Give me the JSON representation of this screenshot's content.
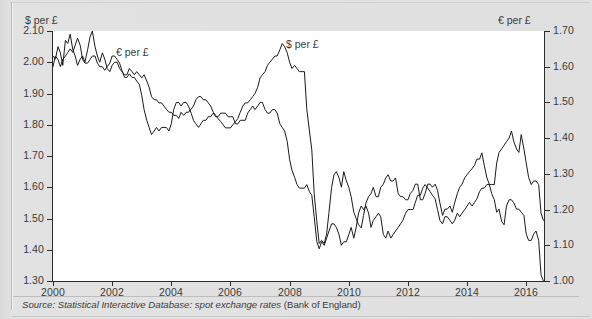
{
  "figure": {
    "source_prefix": "Source: Statistical Interactive Database: spot exchange rates",
    "source_suffix": " (Bank of England)"
  },
  "axes": {
    "left_title": "$ per £",
    "right_title": "€ per £",
    "left_ticks": [
      "2.10",
      "2.00",
      "1.90",
      "1.80",
      "1.70",
      "1.60",
      "1.50",
      "1.40",
      "1.30"
    ],
    "right_ticks": [
      "1.70",
      "1.60",
      "1.50",
      "1.40",
      "1.30",
      "1.20",
      "1.10",
      "1.00"
    ],
    "bottom_ticks": [
      "2000",
      "2002",
      "2004",
      "2006",
      "2008",
      "2010",
      "2012",
      "2014",
      "2016"
    ]
  },
  "labels": {
    "eur_series": "€ per £",
    "usd_series": "$ per £"
  },
  "colors": {
    "line": "#1a1a1a",
    "background": "#e0e0e0",
    "plot_background": "#ffffff",
    "axis": "#2b2b2b"
  },
  "chart_data": {
    "type": "line",
    "title": "",
    "subtitle": "",
    "xlabel": "",
    "ylabel": "$ per £",
    "y2label": "€ per £",
    "grid": false,
    "legend": "inline-annotations",
    "xlim": [
      2000.0,
      2016.6
    ],
    "ylim": [
      1.3,
      2.1
    ],
    "y2lim": [
      1.0,
      1.7
    ],
    "xticks": [
      2000,
      2002,
      2004,
      2006,
      2008,
      2010,
      2012,
      2014,
      2016
    ],
    "yticks": [
      1.3,
      1.4,
      1.5,
      1.6,
      1.7,
      1.8,
      1.9,
      2.0,
      2.1
    ],
    "y2ticks": [
      1.0,
      1.1,
      1.2,
      1.3,
      1.4,
      1.5,
      1.6,
      1.7
    ],
    "annotations": [
      {
        "text": "€ per £",
        "x": 2001.0,
        "axis": "right"
      },
      {
        "text": "$ per £",
        "x": 2007.6,
        "axis": "left"
      }
    ],
    "series": [
      {
        "name": "$ per £",
        "axis": "left",
        "units": "US dollars per pound sterling",
        "x": [
          2000.0,
          2000.08,
          2000.17,
          2000.25,
          2000.33,
          2000.42,
          2000.5,
          2000.58,
          2000.67,
          2000.75,
          2000.83,
          2000.92,
          2001.0,
          2001.08,
          2001.17,
          2001.25,
          2001.33,
          2001.42,
          2001.5,
          2001.58,
          2001.67,
          2001.75,
          2001.83,
          2001.92,
          2002.0,
          2002.08,
          2002.17,
          2002.25,
          2002.33,
          2002.42,
          2002.5,
          2002.58,
          2002.67,
          2002.75,
          2002.83,
          2002.92,
          2003.0,
          2003.08,
          2003.17,
          2003.25,
          2003.33,
          2003.42,
          2003.5,
          2003.58,
          2003.67,
          2003.75,
          2003.83,
          2003.92,
          2004.0,
          2004.08,
          2004.17,
          2004.25,
          2004.33,
          2004.42,
          2004.5,
          2004.58,
          2004.67,
          2004.75,
          2004.83,
          2004.92,
          2005.0,
          2005.08,
          2005.17,
          2005.25,
          2005.33,
          2005.42,
          2005.5,
          2005.58,
          2005.67,
          2005.75,
          2005.83,
          2005.92,
          2006.0,
          2006.08,
          2006.17,
          2006.25,
          2006.33,
          2006.42,
          2006.5,
          2006.58,
          2006.67,
          2006.75,
          2006.83,
          2006.92,
          2007.0,
          2007.08,
          2007.17,
          2007.25,
          2007.33,
          2007.42,
          2007.5,
          2007.58,
          2007.67,
          2007.75,
          2007.83,
          2007.92,
          2008.0,
          2008.08,
          2008.17,
          2008.25,
          2008.33,
          2008.42,
          2008.5,
          2008.58,
          2008.67,
          2008.75,
          2008.83,
          2008.92,
          2009.0,
          2009.08,
          2009.17,
          2009.25,
          2009.33,
          2009.42,
          2009.5,
          2009.58,
          2009.67,
          2009.75,
          2009.83,
          2009.92,
          2010.0,
          2010.08,
          2010.17,
          2010.25,
          2010.33,
          2010.42,
          2010.5,
          2010.58,
          2010.67,
          2010.75,
          2010.83,
          2010.92,
          2011.0,
          2011.08,
          2011.17,
          2011.25,
          2011.33,
          2011.42,
          2011.5,
          2011.58,
          2011.67,
          2011.75,
          2011.83,
          2011.92,
          2012.0,
          2012.08,
          2012.17,
          2012.25,
          2012.33,
          2012.42,
          2012.5,
          2012.58,
          2012.67,
          2012.75,
          2012.83,
          2012.92,
          2013.0,
          2013.08,
          2013.17,
          2013.25,
          2013.33,
          2013.42,
          2013.5,
          2013.58,
          2013.67,
          2013.75,
          2013.83,
          2013.92,
          2014.0,
          2014.08,
          2014.17,
          2014.25,
          2014.33,
          2014.42,
          2014.5,
          2014.58,
          2014.67,
          2014.75,
          2014.83,
          2014.92,
          2015.0,
          2015.08,
          2015.17,
          2015.25,
          2015.33,
          2015.42,
          2015.5,
          2015.58,
          2015.67,
          2015.75,
          2015.83,
          2015.92,
          2016.0,
          2016.08,
          2016.17,
          2016.25,
          2016.33,
          2016.42,
          2016.5,
          2016.58
        ],
        "y": [
          2.02,
          2.01,
          2.05,
          2.03,
          1.99,
          2.07,
          2.06,
          2.09,
          2.04,
          2.02,
          1.99,
          2.01,
          2.02,
          2.0,
          2.04,
          2.08,
          2.1,
          2.05,
          2.02,
          2.0,
          2.03,
          2.01,
          1.98,
          1.97,
          1.99,
          2.0,
          2.0,
          1.98,
          1.97,
          1.96,
          1.96,
          1.98,
          1.97,
          1.96,
          1.97,
          1.96,
          1.95,
          1.96,
          1.94,
          1.92,
          1.89,
          1.88,
          1.88,
          1.87,
          1.87,
          1.86,
          1.85,
          1.84,
          1.84,
          1.83,
          1.83,
          1.82,
          1.84,
          1.83,
          1.84,
          1.84,
          1.85,
          1.86,
          1.88,
          1.89,
          1.89,
          1.88,
          1.88,
          1.87,
          1.86,
          1.84,
          1.83,
          1.82,
          1.81,
          1.8,
          1.79,
          1.79,
          1.79,
          1.8,
          1.81,
          1.82,
          1.84,
          1.86,
          1.87,
          1.87,
          1.88,
          1.89,
          1.9,
          1.92,
          1.95,
          1.96,
          1.97,
          1.99,
          2.0,
          2.01,
          2.02,
          2.02,
          2.04,
          2.06,
          2.05,
          2.03,
          2.0,
          1.98,
          1.99,
          1.98,
          1.97,
          1.97,
          1.97,
          1.85,
          1.78,
          1.72,
          1.58,
          1.49,
          1.42,
          1.43,
          1.42,
          1.45,
          1.52,
          1.6,
          1.64,
          1.65,
          1.63,
          1.6,
          1.65,
          1.62,
          1.6,
          1.57,
          1.52,
          1.5,
          1.48,
          1.47,
          1.51,
          1.55,
          1.57,
          1.58,
          1.6,
          1.57,
          1.57,
          1.6,
          1.61,
          1.63,
          1.64,
          1.62,
          1.62,
          1.63,
          1.58,
          1.57,
          1.57,
          1.56,
          1.56,
          1.58,
          1.59,
          1.61,
          1.61,
          1.56,
          1.56,
          1.58,
          1.61,
          1.61,
          1.6,
          1.61,
          1.59,
          1.55,
          1.51,
          1.53,
          1.53,
          1.54,
          1.52,
          1.55,
          1.58,
          1.6,
          1.61,
          1.63,
          1.64,
          1.65,
          1.66,
          1.67,
          1.69,
          1.69,
          1.71,
          1.67,
          1.63,
          1.61,
          1.58,
          1.56,
          1.52,
          1.53,
          1.49,
          1.48,
          1.54,
          1.56,
          1.56,
          1.55,
          1.53,
          1.53,
          1.52,
          1.51,
          1.45,
          1.43,
          1.43,
          1.45,
          1.46,
          1.43,
          1.32,
          1.3
        ]
      },
      {
        "name": "€ per £",
        "axis": "right",
        "units": "euros per pound sterling",
        "x": [
          2000.0,
          2000.08,
          2000.17,
          2000.25,
          2000.33,
          2000.42,
          2000.5,
          2000.58,
          2000.67,
          2000.75,
          2000.83,
          2000.92,
          2001.0,
          2001.08,
          2001.17,
          2001.25,
          2001.33,
          2001.42,
          2001.5,
          2001.58,
          2001.67,
          2001.75,
          2001.83,
          2001.92,
          2002.0,
          2002.08,
          2002.17,
          2002.25,
          2002.33,
          2002.42,
          2002.5,
          2002.58,
          2002.67,
          2002.75,
          2002.83,
          2002.92,
          2003.0,
          2003.08,
          2003.17,
          2003.25,
          2003.33,
          2003.42,
          2003.5,
          2003.58,
          2003.67,
          2003.75,
          2003.83,
          2003.92,
          2004.0,
          2004.08,
          2004.17,
          2004.25,
          2004.33,
          2004.42,
          2004.5,
          2004.58,
          2004.67,
          2004.75,
          2004.83,
          2004.92,
          2005.0,
          2005.08,
          2005.17,
          2005.25,
          2005.33,
          2005.42,
          2005.5,
          2005.58,
          2005.67,
          2005.75,
          2005.83,
          2005.92,
          2006.0,
          2006.08,
          2006.17,
          2006.25,
          2006.33,
          2006.42,
          2006.5,
          2006.58,
          2006.67,
          2006.75,
          2006.83,
          2006.92,
          2007.0,
          2007.08,
          2007.17,
          2007.25,
          2007.33,
          2007.42,
          2007.5,
          2007.58,
          2007.67,
          2007.75,
          2007.83,
          2007.92,
          2008.0,
          2008.08,
          2008.17,
          2008.25,
          2008.33,
          2008.42,
          2008.5,
          2008.58,
          2008.67,
          2008.75,
          2008.83,
          2008.92,
          2009.0,
          2009.08,
          2009.17,
          2009.25,
          2009.33,
          2009.42,
          2009.5,
          2009.58,
          2009.67,
          2009.75,
          2009.83,
          2009.92,
          2010.0,
          2010.08,
          2010.17,
          2010.25,
          2010.33,
          2010.42,
          2010.5,
          2010.58,
          2010.67,
          2010.75,
          2010.83,
          2010.92,
          2011.0,
          2011.08,
          2011.17,
          2011.25,
          2011.33,
          2011.42,
          2011.5,
          2011.58,
          2011.67,
          2011.75,
          2011.83,
          2011.92,
          2012.0,
          2012.08,
          2012.17,
          2012.25,
          2012.33,
          2012.42,
          2012.5,
          2012.58,
          2012.67,
          2012.75,
          2012.83,
          2012.92,
          2013.0,
          2013.08,
          2013.17,
          2013.25,
          2013.33,
          2013.42,
          2013.5,
          2013.58,
          2013.67,
          2013.75,
          2013.83,
          2013.92,
          2014.0,
          2014.08,
          2014.17,
          2014.25,
          2014.33,
          2014.42,
          2014.5,
          2014.58,
          2014.67,
          2014.75,
          2014.83,
          2014.92,
          2015.0,
          2015.08,
          2015.17,
          2015.25,
          2015.33,
          2015.42,
          2015.5,
          2015.58,
          2015.67,
          2015.75,
          2015.83,
          2015.92,
          2016.0,
          2016.08,
          2016.17,
          2016.25,
          2016.33,
          2016.42,
          2016.5,
          2016.58
        ],
        "y": [
          1.6,
          1.63,
          1.62,
          1.6,
          1.62,
          1.63,
          1.64,
          1.65,
          1.64,
          1.66,
          1.68,
          1.66,
          1.62,
          1.61,
          1.61,
          1.62,
          1.63,
          1.63,
          1.61,
          1.6,
          1.6,
          1.59,
          1.6,
          1.61,
          1.63,
          1.63,
          1.62,
          1.61,
          1.59,
          1.57,
          1.57,
          1.58,
          1.57,
          1.57,
          1.56,
          1.55,
          1.52,
          1.48,
          1.45,
          1.43,
          1.41,
          1.42,
          1.43,
          1.42,
          1.43,
          1.43,
          1.43,
          1.42,
          1.44,
          1.48,
          1.5,
          1.5,
          1.49,
          1.5,
          1.5,
          1.49,
          1.47,
          1.45,
          1.44,
          1.43,
          1.44,
          1.45,
          1.45,
          1.46,
          1.46,
          1.47,
          1.46,
          1.46,
          1.47,
          1.47,
          1.47,
          1.46,
          1.46,
          1.46,
          1.44,
          1.44,
          1.45,
          1.45,
          1.45,
          1.47,
          1.48,
          1.49,
          1.48,
          1.49,
          1.5,
          1.5,
          1.48,
          1.47,
          1.47,
          1.48,
          1.48,
          1.47,
          1.44,
          1.43,
          1.42,
          1.39,
          1.34,
          1.31,
          1.29,
          1.27,
          1.26,
          1.26,
          1.26,
          1.27,
          1.25,
          1.24,
          1.18,
          1.11,
          1.09,
          1.11,
          1.1,
          1.12,
          1.14,
          1.16,
          1.16,
          1.15,
          1.13,
          1.1,
          1.11,
          1.11,
          1.13,
          1.15,
          1.12,
          1.15,
          1.19,
          1.21,
          1.2,
          1.21,
          1.19,
          1.15,
          1.17,
          1.18,
          1.19,
          1.18,
          1.13,
          1.12,
          1.14,
          1.12,
          1.13,
          1.14,
          1.15,
          1.16,
          1.17,
          1.19,
          1.2,
          1.2,
          1.2,
          1.22,
          1.24,
          1.24,
          1.26,
          1.27,
          1.26,
          1.25,
          1.24,
          1.23,
          1.2,
          1.17,
          1.16,
          1.18,
          1.18,
          1.17,
          1.16,
          1.17,
          1.19,
          1.18,
          1.19,
          1.2,
          1.21,
          1.22,
          1.21,
          1.22,
          1.23,
          1.25,
          1.26,
          1.26,
          1.27,
          1.27,
          1.27,
          1.27,
          1.33,
          1.36,
          1.37,
          1.38,
          1.39,
          1.4,
          1.42,
          1.39,
          1.37,
          1.36,
          1.41,
          1.37,
          1.33,
          1.29,
          1.27,
          1.28,
          1.28,
          1.27,
          1.19,
          1.17
        ]
      }
    ]
  }
}
